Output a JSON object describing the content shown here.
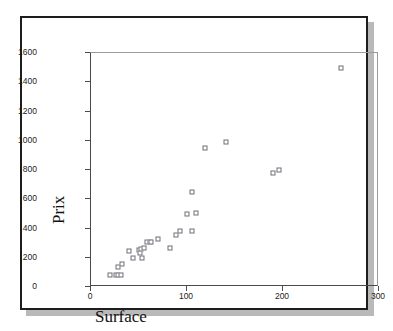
{
  "chart_data": {
    "type": "scatter",
    "title": "",
    "xlabel": "Surface",
    "ylabel": "Prix",
    "xlim": [
      0,
      300
    ],
    "ylim": [
      0,
      1600
    ],
    "xticks": [
      0,
      100,
      200,
      300
    ],
    "yticks": [
      0,
      200,
      400,
      600,
      800,
      1000,
      1200,
      1400,
      1600
    ],
    "grid": false,
    "legend": null,
    "marker": "open-square",
    "marker_color": "#6e6e78",
    "series": [
      {
        "name": "Prix vs Surface",
        "points": [
          [
            20,
            80
          ],
          [
            26,
            85
          ],
          [
            28,
            80
          ],
          [
            28,
            135
          ],
          [
            31,
            82
          ],
          [
            32,
            155
          ],
          [
            40,
            245
          ],
          [
            44,
            200
          ],
          [
            50,
            250
          ],
          [
            51,
            230
          ],
          [
            52,
            260
          ],
          [
            53,
            200
          ],
          [
            55,
            265
          ],
          [
            58,
            305
          ],
          [
            61,
            310
          ],
          [
            63,
            305
          ],
          [
            70,
            325
          ],
          [
            82,
            270
          ],
          [
            89,
            355
          ],
          [
            93,
            380
          ],
          [
            100,
            500
          ],
          [
            105,
            380
          ],
          [
            105,
            650
          ],
          [
            109,
            505
          ],
          [
            119,
            950
          ],
          [
            141,
            990
          ],
          [
            190,
            780
          ],
          [
            196,
            800
          ],
          [
            260,
            1500
          ]
        ]
      }
    ]
  },
  "axes": {
    "x_tick_labels": [
      "0",
      "100",
      "200",
      "300"
    ],
    "y_tick_labels": [
      "0",
      "200",
      "400",
      "600",
      "800",
      "1000",
      "1200",
      "1400",
      "1600"
    ],
    "x_title": "Surface",
    "y_title": "Prix"
  },
  "style": {
    "frame_color": "#1d1d1d",
    "shadow_color": "#b9b9b9",
    "axis_color": "#4a4a4a",
    "marker_edge_color": "#6e6e78",
    "background": "#ffffff"
  }
}
